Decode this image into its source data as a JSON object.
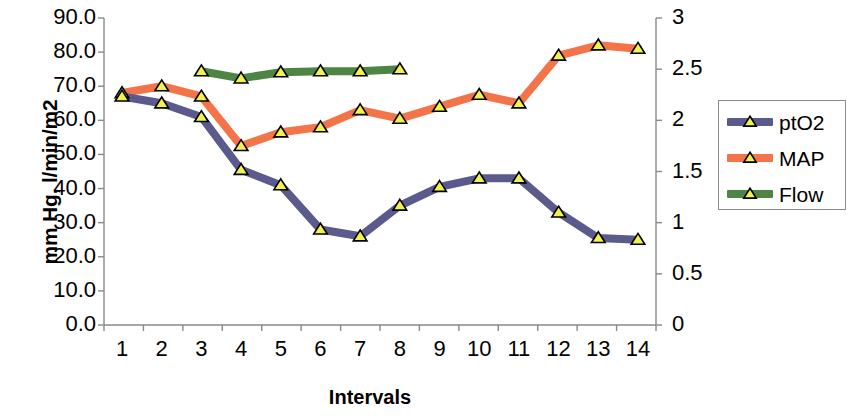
{
  "chart_data": {
    "type": "line",
    "title": "",
    "xlabel": "Intervals",
    "ylabel": "mm Hg, l/min/m2",
    "y2label": "",
    "categories": [
      "1",
      "2",
      "3",
      "4",
      "5",
      "6",
      "7",
      "8",
      "9",
      "10",
      "11",
      "12",
      "13",
      "14"
    ],
    "x": [
      1,
      2,
      3,
      4,
      5,
      6,
      7,
      8,
      9,
      10,
      11,
      12,
      13,
      14
    ],
    "ylim": [
      0,
      90
    ],
    "y2lim": [
      0,
      3
    ],
    "yticks": [
      "0.0",
      "10.0",
      "20.0",
      "30.0",
      "40.0",
      "50.0",
      "60.0",
      "70.0",
      "80.0",
      "90.0"
    ],
    "ytick_values": [
      0,
      10,
      20,
      30,
      40,
      50,
      60,
      70,
      80,
      90
    ],
    "y2ticks": [
      "0",
      "0.5",
      "1",
      "1.5",
      "2",
      "2.5",
      "3"
    ],
    "y2tick_values": [
      0,
      0.5,
      1,
      1.5,
      2,
      2.5,
      3
    ],
    "grid": false,
    "legend_position": "right",
    "marker": "triangle",
    "marker_fill": "#f2f24a",
    "marker_edge": "#000000",
    "series": [
      {
        "name": "ptO2",
        "axis": "left",
        "color": "#5b5a8c",
        "values": [
          67,
          65,
          61,
          45.5,
          41,
          28,
          26,
          35,
          40.5,
          43,
          43,
          33,
          25.5,
          25
        ]
      },
      {
        "name": "MAP",
        "axis": "left",
        "color": "#f4744a",
        "values": [
          68,
          70,
          67,
          52.5,
          56.5,
          58,
          63,
          60.5,
          64,
          67.5,
          65,
          79,
          82,
          81
        ]
      },
      {
        "name": "Flow",
        "axis": "right",
        "color": "#4e8545",
        "values": [
          null,
          null,
          2.48,
          2.41,
          2.47,
          2.48,
          2.48,
          2.5,
          null,
          null,
          null,
          null,
          null,
          null
        ]
      }
    ]
  },
  "legend": {
    "items": [
      {
        "label": "ptO2",
        "color": "#5b5a8c"
      },
      {
        "label": "MAP",
        "color": "#f4744a"
      },
      {
        "label": "Flow",
        "color": "#4e8545"
      }
    ]
  },
  "axes": {
    "x_title": "Intervals",
    "y_title": "mm Hg, l/min/m2"
  }
}
